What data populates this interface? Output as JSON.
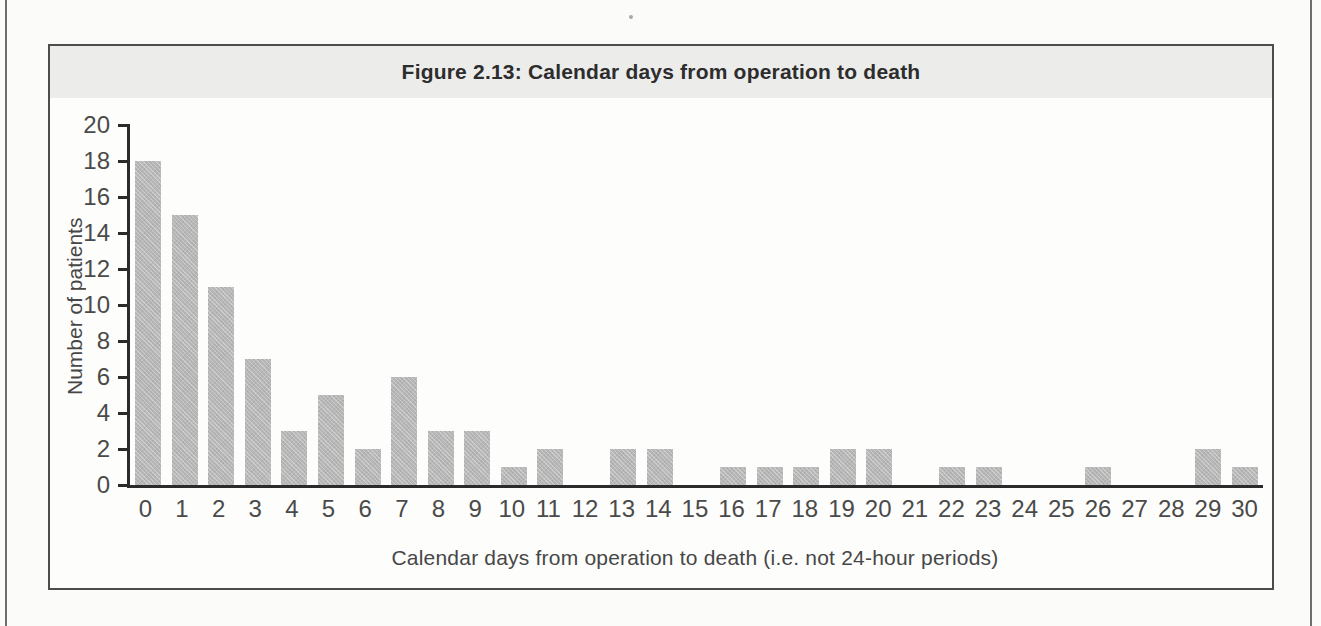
{
  "figure": {
    "title": "Figure 2.13: Calendar days from operation to death",
    "colors": {
      "page_background": "#fbfbf9",
      "page_rule": "#6e6e6e",
      "box_border": "#4c4c4c",
      "title_band": "#ececeb",
      "bar_fill": "#b7b7b7",
      "axis_line": "#2b2b2b",
      "text": "#474747"
    }
  },
  "chart_data": {
    "type": "bar",
    "title": "Figure 2.13: Calendar days from operation to death",
    "xlabel": "Calendar days from operation to death (i.e. not 24-hour periods)",
    "ylabel": "Number of patients",
    "categories": [
      0,
      1,
      2,
      3,
      4,
      5,
      6,
      7,
      8,
      9,
      10,
      11,
      12,
      13,
      14,
      15,
      16,
      17,
      18,
      19,
      20,
      21,
      22,
      23,
      24,
      25,
      26,
      27,
      28,
      29,
      30
    ],
    "values": [
      18,
      15,
      11,
      7,
      3,
      5,
      2,
      6,
      3,
      3,
      1,
      2,
      0,
      2,
      2,
      0,
      1,
      1,
      1,
      2,
      2,
      0,
      1,
      1,
      0,
      0,
      1,
      0,
      0,
      2,
      1
    ],
    "ylim": [
      0,
      20
    ],
    "yticks": [
      0,
      2,
      4,
      6,
      8,
      10,
      12,
      14,
      16,
      18,
      20
    ],
    "grid": false,
    "legend": null,
    "bar_color": "#b7b7b7",
    "axis_color": "#2b2b2b"
  }
}
